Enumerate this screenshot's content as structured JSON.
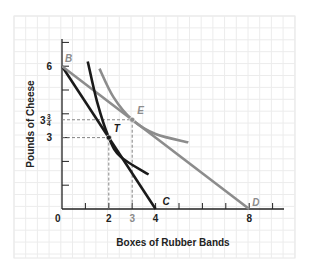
{
  "chart_data": {
    "type": "line",
    "title": "",
    "xlabel": "Boxes of Rubber Bands",
    "ylabel": "Pounds of Cheese",
    "xlim": [
      0,
      9
    ],
    "ylim": [
      0,
      7
    ],
    "grid": true,
    "x_ticks": [
      {
        "value": 2,
        "label": "2",
        "color": "#222222"
      },
      {
        "value": 3,
        "label": "3",
        "color": "#8a8a8a"
      },
      {
        "value": 4,
        "label": "4",
        "color": "#222222"
      },
      {
        "value": 8,
        "label": "8",
        "color": "#222222"
      }
    ],
    "y_ticks": [
      {
        "value": 3,
        "label": "3"
      },
      {
        "value": 3.75,
        "label_whole": "3",
        "label_num": "3",
        "label_den": "4"
      },
      {
        "value": 6,
        "label": "6"
      }
    ],
    "origin_label": "0",
    "series": [
      {
        "name": "Budget line BC",
        "color": "#1a1a1a",
        "points": [
          [
            0,
            6
          ],
          [
            4,
            0
          ]
        ]
      },
      {
        "name": "Budget line BD",
        "color": "#8c8c8c",
        "points": [
          [
            0,
            6
          ],
          [
            8,
            0
          ]
        ]
      },
      {
        "name": "Indifference curve through T",
        "color": "#1a1a1a",
        "points": [
          [
            1.1,
            6.2
          ],
          [
            1.5,
            4.5
          ],
          [
            2,
            3
          ],
          [
            2.5,
            2.2
          ],
          [
            3.7,
            1.45
          ]
        ]
      },
      {
        "name": "Indifference curve through E",
        "color": "#8c8c8c",
        "points": [
          [
            1.6,
            5.9
          ],
          [
            2.2,
            4.7
          ],
          [
            3,
            3.75
          ],
          [
            4,
            3.15
          ],
          [
            5.4,
            2.8
          ]
        ]
      }
    ],
    "points": [
      {
        "label": "B",
        "x": 0,
        "y": 6,
        "color": "#8c8c8c"
      },
      {
        "label": "T",
        "x": 2,
        "y": 3,
        "color": "#1a1a1a"
      },
      {
        "label": "E",
        "x": 3,
        "y": 3.75,
        "color": "#8c8c8c"
      },
      {
        "label": "C",
        "x": 4,
        "y": 0,
        "color": "#1a1a1a"
      },
      {
        "label": "D",
        "x": 8,
        "y": 0,
        "color": "#8c8c8c"
      }
    ],
    "guides": [
      {
        "from": [
          0,
          3
        ],
        "to": [
          2,
          3
        ],
        "style": "dashed"
      },
      {
        "from": [
          2,
          3
        ],
        "to": [
          2,
          0
        ],
        "style": "dashed"
      },
      {
        "from": [
          0,
          3.75
        ],
        "to": [
          3,
          3.75
        ],
        "style": "dashed"
      },
      {
        "from": [
          3,
          3.75
        ],
        "to": [
          3,
          0
        ],
        "style": "dashed"
      }
    ]
  }
}
